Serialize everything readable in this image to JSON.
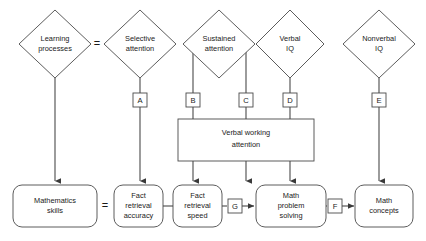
{
  "diagram": {
    "colors": {
      "stroke": "#4a4a4a",
      "fill": "#ffffff",
      "text": "#1a1a1a"
    },
    "diamonds": [
      {
        "id": "learning-processes",
        "label_line1": "Learning",
        "label_line2": "processes"
      },
      {
        "id": "selective-attention",
        "label_line1": "Selective",
        "label_line2": "attention"
      },
      {
        "id": "sustained-attention",
        "label_line1": "Sustained",
        "label_line2": "attention"
      },
      {
        "id": "verbal-iq",
        "label_line1": "Verbal",
        "label_line2": "IQ"
      },
      {
        "id": "nonverbal-iq",
        "label_line1": "Nonverbal",
        "label_line2": "IQ"
      }
    ],
    "middle_box": {
      "id": "verbal-working-attention",
      "label_line1": "Verbal working",
      "label_line2": "attention"
    },
    "boxes": [
      {
        "id": "mathematics-skills",
        "label_line1": "Mathematics",
        "label_line2": "skills",
        "label_line3": ""
      },
      {
        "id": "fact-retrieval-accuracy",
        "label_line1": "Fact",
        "label_line2": "retrieval",
        "label_line3": "accuracy"
      },
      {
        "id": "fact-retrieval-speed",
        "label_line1": "Fact",
        "label_line2": "retrieval",
        "label_line3": "speed"
      },
      {
        "id": "math-problem-solving",
        "label_line1": "Math",
        "label_line2": "problem",
        "label_line3": "solving"
      },
      {
        "id": "math-concepts",
        "label_line1": "Math",
        "label_line2": "concepts",
        "label_line3": ""
      }
    ],
    "path_labels": [
      {
        "id": "path-a",
        "label": "A"
      },
      {
        "id": "path-b",
        "label": "B"
      },
      {
        "id": "path-c",
        "label": "C"
      },
      {
        "id": "path-d",
        "label": "D"
      },
      {
        "id": "path-e",
        "label": "E"
      },
      {
        "id": "path-f",
        "label": "F"
      },
      {
        "id": "path-g",
        "label": "G"
      }
    ],
    "equals_signs": [
      {
        "id": "equals-top",
        "label": "="
      },
      {
        "id": "equals-bottom",
        "label": "="
      }
    ]
  }
}
